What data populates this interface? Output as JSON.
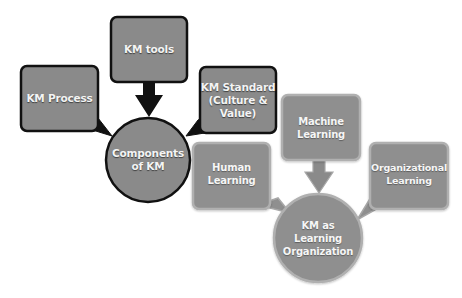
{
  "diagram": {
    "colors": {
      "dark_group_fill": "#8a8a8a",
      "dark_group_border": "#111111",
      "light_group_fill": "#8f8f8f",
      "light_group_border": "#a8a8a8",
      "text": "#f4f4f4",
      "background": "#ffffff"
    },
    "components_group": {
      "hub": {
        "label": "Components\nof KM",
        "shape": "circle"
      },
      "nodes": [
        {
          "label": "KM Process",
          "shape": "callout-box",
          "connector": "wedge-to-hub"
        },
        {
          "label": "KM tools",
          "shape": "box",
          "connector": "down-arrow-to-hub"
        },
        {
          "label": "KM Standard\n(Culture &\nValue)",
          "shape": "callout-box",
          "connector": "wedge-to-hub"
        }
      ]
    },
    "learning_group": {
      "hub": {
        "label": "KM as\nLearning\nOrganization",
        "shape": "circle"
      },
      "nodes": [
        {
          "label": "Human\nLearning",
          "shape": "callout-box",
          "connector": "wedge-to-hub"
        },
        {
          "label": "Machine\nLearning",
          "shape": "box",
          "connector": "down-arrow-to-hub"
        },
        {
          "label": "Organizational\nLearning",
          "shape": "callout-box",
          "connector": "wedge-to-hub"
        }
      ]
    }
  }
}
